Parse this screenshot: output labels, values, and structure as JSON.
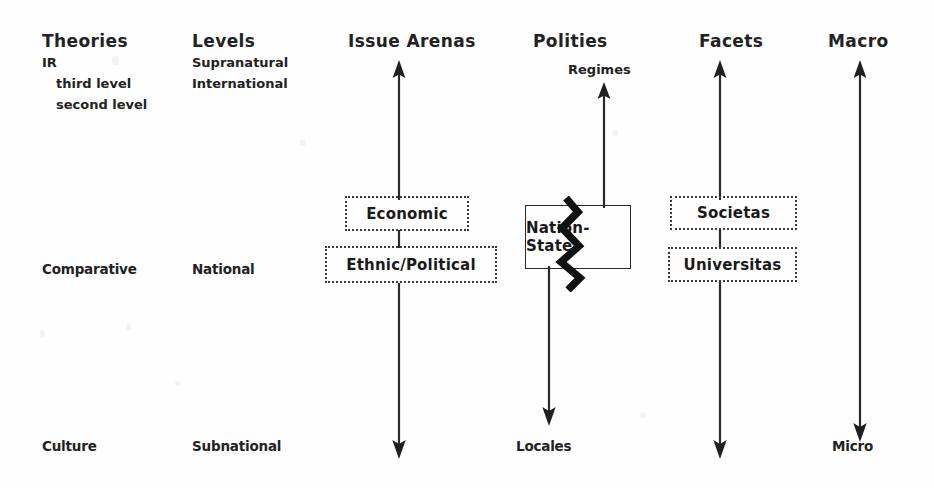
{
  "diagram": {
    "columns": [
      {
        "id": "theories",
        "header": "Theories",
        "items": [
          {
            "label": "IR"
          },
          {
            "label": "third level"
          },
          {
            "label": "second level"
          },
          {
            "label": "Comparative"
          },
          {
            "label": "Culture"
          }
        ]
      },
      {
        "id": "levels",
        "header": "Levels",
        "items": [
          {
            "label": "Supranatural"
          },
          {
            "label": "International"
          },
          {
            "label": "National"
          },
          {
            "label": "Subnational"
          }
        ]
      },
      {
        "id": "issue-arenas",
        "header": "Issue Arenas",
        "boxes": [
          {
            "label": "Economic"
          },
          {
            "label": "Ethnic/Political"
          }
        ]
      },
      {
        "id": "polities",
        "header": "Polities",
        "top_label": "Regimes",
        "bottom_label": "Locales",
        "boxes": [
          {
            "label": "Nation-State"
          }
        ]
      },
      {
        "id": "facets",
        "header": "Facets",
        "boxes": [
          {
            "label": "Societas"
          },
          {
            "label": "Universitas"
          }
        ]
      },
      {
        "id": "scale",
        "header": "Macro",
        "bottom_label": "Micro"
      }
    ],
    "colors": {
      "ink": "#1c1c1c",
      "box_border": "#3a3a3a",
      "background": "#fefefe"
    },
    "icons": {
      "arrow_up": "up-arrow-icon",
      "arrow_down": "down-arrow-icon",
      "arrow_double": "double-headed-arrow-icon",
      "zigzag": "zigzag-fracture-icon"
    }
  }
}
